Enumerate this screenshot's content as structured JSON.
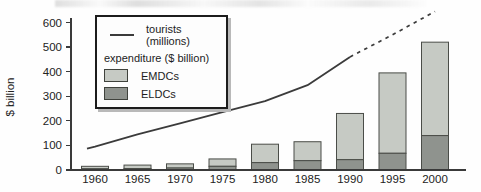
{
  "figure": {
    "y_axis_title": "$ billion",
    "colors": {
      "emdc": "#c6cac4",
      "eldc": "#8f938e",
      "line": "#3b3b3b",
      "axis": "#3a3a3a",
      "bar_border": "#4a4d48",
      "text": "#222222"
    },
    "legend": {
      "tourists_label": "tourists (millions)",
      "expenditure_label": "expenditure ($ billion)",
      "emdc_label": "EMDCs",
      "eldc_label": "ELDCs"
    }
  },
  "chart_data": {
    "type": "combo-stacked-bar-line",
    "title": "",
    "xlabel": "",
    "ylabel": "$ billion",
    "ylim": [
      0,
      600
    ],
    "ytick_step": 100,
    "grid": false,
    "legend_position": "top-left",
    "categories": [
      "1960",
      "1965",
      "1970",
      "1975",
      "1980",
      "1985",
      "1990",
      "1995",
      "2000"
    ],
    "series": [
      {
        "name": "ELDCs",
        "type": "bar",
        "stack": "expenditure ($ billion)",
        "values": [
          5,
          6,
          8,
          15,
          30,
          38,
          42,
          68,
          140
        ]
      },
      {
        "name": "EMDCs",
        "type": "bar",
        "stack": "expenditure ($ billion)",
        "values": [
          10,
          14,
          17,
          30,
          75,
          77,
          188,
          327,
          380
        ]
      },
      {
        "name": "tourists (millions)",
        "type": "line",
        "values": [
          95,
          145,
          190,
          235,
          280,
          345,
          460,
          550,
          645
        ],
        "dashed_from_index": 6,
        "note": "line is dashed (projected) after 1990"
      }
    ]
  }
}
